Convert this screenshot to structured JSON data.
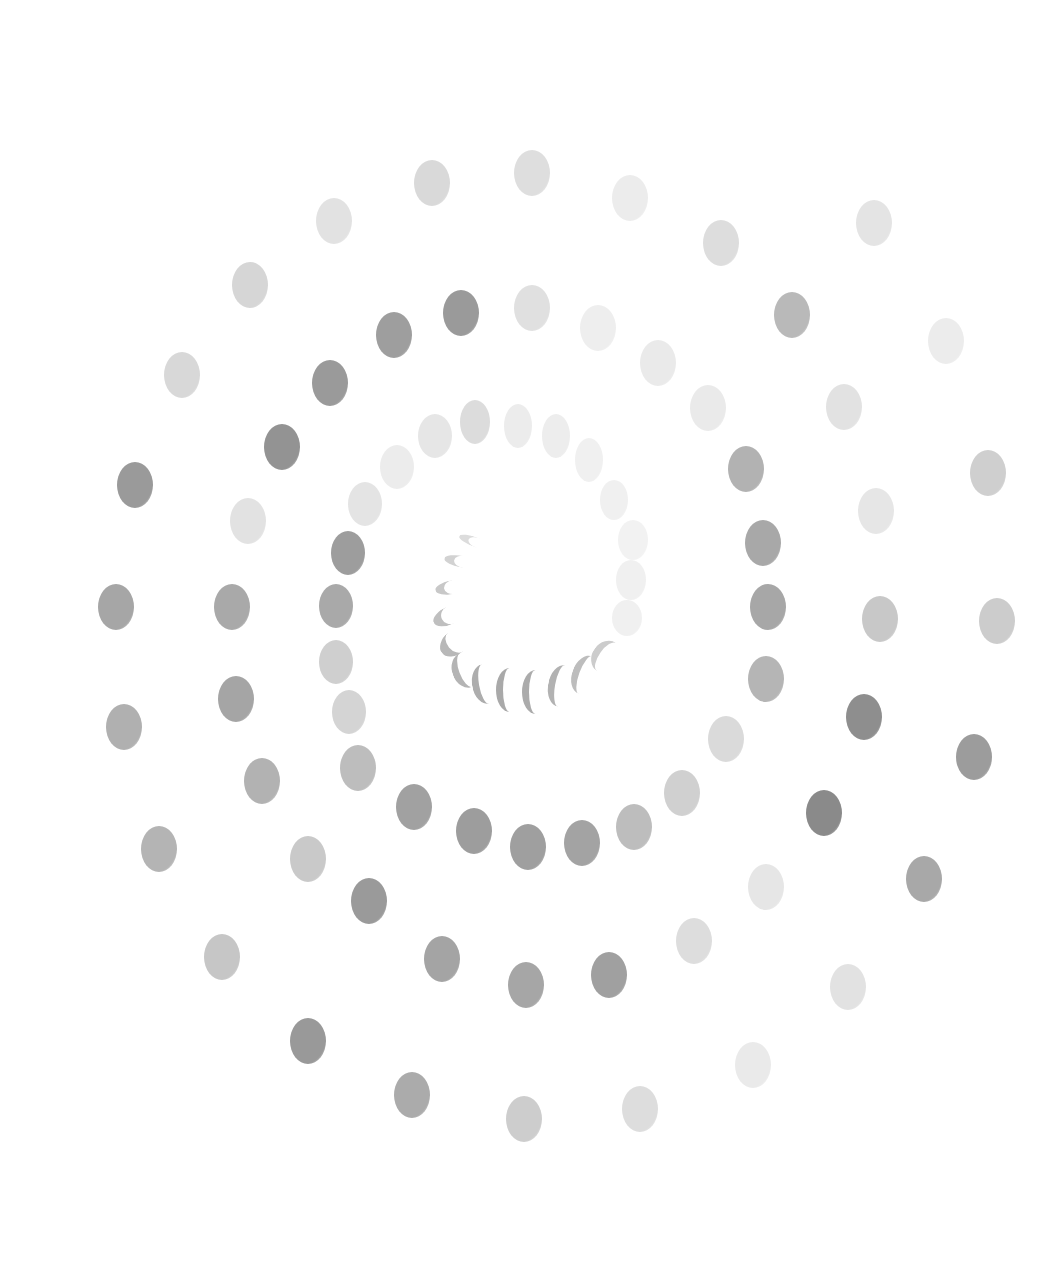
{
  "image": {
    "description": "Spiral of grey oval dots on white background",
    "background": "#ffffff",
    "width": 1043,
    "height": 1264
  },
  "dots": [
    {
      "x": 414,
      "y": 160,
      "w": 36,
      "h": 46,
      "c": "#d9d9d9"
    },
    {
      "x": 514,
      "y": 150,
      "w": 36,
      "h": 46,
      "c": "#dedede"
    },
    {
      "x": 612,
      "y": 175,
      "w": 36,
      "h": 46,
      "c": "#ececec"
    },
    {
      "x": 703,
      "y": 220,
      "w": 36,
      "h": 46,
      "c": "#dddddd"
    },
    {
      "x": 856,
      "y": 200,
      "w": 36,
      "h": 46,
      "c": "#e4e4e4"
    },
    {
      "x": 316,
      "y": 198,
      "w": 36,
      "h": 46,
      "c": "#e2e2e2"
    },
    {
      "x": 232,
      "y": 262,
      "w": 36,
      "h": 46,
      "c": "#d6d6d6"
    },
    {
      "x": 443,
      "y": 290,
      "w": 36,
      "h": 46,
      "c": "#9a9a9a"
    },
    {
      "x": 514,
      "y": 285,
      "w": 36,
      "h": 46,
      "c": "#e0e0e0"
    },
    {
      "x": 580,
      "y": 305,
      "w": 36,
      "h": 46,
      "c": "#eeeeee"
    },
    {
      "x": 640,
      "y": 340,
      "w": 36,
      "h": 46,
      "c": "#eaeaea"
    },
    {
      "x": 774,
      "y": 292,
      "w": 36,
      "h": 46,
      "c": "#b9b9b9"
    },
    {
      "x": 928,
      "y": 318,
      "w": 36,
      "h": 46,
      "c": "#ececec"
    },
    {
      "x": 376,
      "y": 312,
      "w": 36,
      "h": 46,
      "c": "#9e9e9e"
    },
    {
      "x": 312,
      "y": 360,
      "w": 36,
      "h": 46,
      "c": "#9a9a9a"
    },
    {
      "x": 164,
      "y": 352,
      "w": 36,
      "h": 46,
      "c": "#d8d8d8"
    },
    {
      "x": 690,
      "y": 385,
      "w": 36,
      "h": 46,
      "c": "#eaeaea"
    },
    {
      "x": 826,
      "y": 384,
      "w": 36,
      "h": 46,
      "c": "#e2e2e2"
    },
    {
      "x": 264,
      "y": 424,
      "w": 36,
      "h": 46,
      "c": "#939393"
    },
    {
      "x": 117,
      "y": 462,
      "w": 36,
      "h": 46,
      "c": "#9a9a9a"
    },
    {
      "x": 728,
      "y": 446,
      "w": 36,
      "h": 46,
      "c": "#b2b2b2"
    },
    {
      "x": 970,
      "y": 450,
      "w": 36,
      "h": 46,
      "c": "#cfcfcf"
    },
    {
      "x": 858,
      "y": 488,
      "w": 36,
      "h": 46,
      "c": "#e6e6e6"
    },
    {
      "x": 230,
      "y": 498,
      "w": 36,
      "h": 46,
      "c": "#e2e2e2"
    },
    {
      "x": 745,
      "y": 520,
      "w": 36,
      "h": 46,
      "c": "#a8a8a8"
    },
    {
      "x": 98,
      "y": 584,
      "w": 36,
      "h": 46,
      "c": "#a6a6a6"
    },
    {
      "x": 214,
      "y": 584,
      "w": 36,
      "h": 46,
      "c": "#a9a9a9"
    },
    {
      "x": 750,
      "y": 584,
      "w": 36,
      "h": 46,
      "c": "#a7a7a7"
    },
    {
      "x": 862,
      "y": 596,
      "w": 36,
      "h": 46,
      "c": "#c8c8c8"
    },
    {
      "x": 979,
      "y": 598,
      "w": 36,
      "h": 46,
      "c": "#cccccc"
    },
    {
      "x": 748,
      "y": 656,
      "w": 36,
      "h": 46,
      "c": "#b5b5b5"
    },
    {
      "x": 218,
      "y": 676,
      "w": 36,
      "h": 46,
      "c": "#a5a5a5"
    },
    {
      "x": 106,
      "y": 704,
      "w": 36,
      "h": 46,
      "c": "#b0b0b0"
    },
    {
      "x": 846,
      "y": 694,
      "w": 36,
      "h": 46,
      "c": "#8e8e8e"
    },
    {
      "x": 956,
      "y": 734,
      "w": 36,
      "h": 46,
      "c": "#9c9c9c"
    },
    {
      "x": 708,
      "y": 716,
      "w": 36,
      "h": 46,
      "c": "#dadada"
    },
    {
      "x": 244,
      "y": 758,
      "w": 36,
      "h": 46,
      "c": "#b2b2b2"
    },
    {
      "x": 664,
      "y": 770,
      "w": 36,
      "h": 46,
      "c": "#d0d0d0"
    },
    {
      "x": 806,
      "y": 790,
      "w": 36,
      "h": 46,
      "c": "#8a8a8a"
    },
    {
      "x": 141,
      "y": 826,
      "w": 36,
      "h": 46,
      "c": "#b4b4b4"
    },
    {
      "x": 290,
      "y": 836,
      "w": 36,
      "h": 46,
      "c": "#c9c9c9"
    },
    {
      "x": 906,
      "y": 856,
      "w": 36,
      "h": 46,
      "c": "#a8a8a8"
    },
    {
      "x": 748,
      "y": 864,
      "w": 36,
      "h": 46,
      "c": "#e6e6e6"
    },
    {
      "x": 351,
      "y": 878,
      "w": 36,
      "h": 46,
      "c": "#9a9a9a"
    },
    {
      "x": 676,
      "y": 918,
      "w": 36,
      "h": 46,
      "c": "#dddddd"
    },
    {
      "x": 204,
      "y": 934,
      "w": 36,
      "h": 46,
      "c": "#c6c6c6"
    },
    {
      "x": 424,
      "y": 936,
      "w": 36,
      "h": 46,
      "c": "#a4a4a4"
    },
    {
      "x": 508,
      "y": 962,
      "w": 36,
      "h": 46,
      "c": "#a6a6a6"
    },
    {
      "x": 591,
      "y": 952,
      "w": 36,
      "h": 46,
      "c": "#a0a0a0"
    },
    {
      "x": 830,
      "y": 964,
      "w": 36,
      "h": 46,
      "c": "#e2e2e2"
    },
    {
      "x": 290,
      "y": 1018,
      "w": 36,
      "h": 46,
      "c": "#999999"
    },
    {
      "x": 735,
      "y": 1042,
      "w": 36,
      "h": 46,
      "c": "#eaeaea"
    },
    {
      "x": 394,
      "y": 1072,
      "w": 36,
      "h": 46,
      "c": "#ababab"
    },
    {
      "x": 622,
      "y": 1086,
      "w": 36,
      "h": 46,
      "c": "#dddddd"
    },
    {
      "x": 506,
      "y": 1096,
      "w": 36,
      "h": 46,
      "c": "#cdcdcd"
    },
    {
      "x": 340,
      "y": 745,
      "w": 36,
      "h": 46,
      "c": "#bdbdbd"
    },
    {
      "x": 396,
      "y": 784,
      "w": 36,
      "h": 46,
      "c": "#a1a1a1"
    },
    {
      "x": 456,
      "y": 808,
      "w": 36,
      "h": 46,
      "c": "#9d9d9d"
    },
    {
      "x": 510,
      "y": 824,
      "w": 36,
      "h": 46,
      "c": "#9f9f9f"
    },
    {
      "x": 564,
      "y": 820,
      "w": 36,
      "h": 46,
      "c": "#a3a3a3"
    },
    {
      "x": 616,
      "y": 804,
      "w": 36,
      "h": 46,
      "c": "#bdbdbd"
    },
    {
      "x": 331,
      "y": 531,
      "w": 34,
      "h": 44,
      "c": "#9d9d9d"
    },
    {
      "x": 319,
      "y": 584,
      "w": 34,
      "h": 44,
      "c": "#a9a9a9"
    },
    {
      "x": 319,
      "y": 640,
      "w": 34,
      "h": 44,
      "c": "#cfcfcf"
    },
    {
      "x": 332,
      "y": 690,
      "w": 34,
      "h": 44,
      "c": "#d4d4d4"
    },
    {
      "x": 348,
      "y": 482,
      "w": 34,
      "h": 44,
      "c": "#e4e4e4"
    },
    {
      "x": 380,
      "y": 445,
      "w": 34,
      "h": 44,
      "c": "#ececec"
    },
    {
      "x": 418,
      "y": 414,
      "w": 34,
      "h": 44,
      "c": "#e6e6e6"
    },
    {
      "x": 460,
      "y": 400,
      "w": 30,
      "h": 44,
      "c": "#dcdcdc"
    },
    {
      "x": 504,
      "y": 404,
      "w": 28,
      "h": 44,
      "c": "#ececec"
    },
    {
      "x": 542,
      "y": 414,
      "w": 28,
      "h": 44,
      "c": "#ededed"
    },
    {
      "x": 575,
      "y": 438,
      "w": 28,
      "h": 44,
      "c": "#f0f0f0"
    },
    {
      "x": 600,
      "y": 480,
      "w": 28,
      "h": 40,
      "c": "#f0f0f0"
    },
    {
      "x": 618,
      "y": 520,
      "w": 30,
      "h": 40,
      "c": "#f2f2f2"
    },
    {
      "x": 616,
      "y": 560,
      "w": 30,
      "h": 40,
      "c": "#f0f0f0"
    },
    {
      "x": 612,
      "y": 600,
      "w": 30,
      "h": 36,
      "c": "#f0f0f0"
    }
  ],
  "crescents": [
    {
      "x": 458,
      "y": 538,
      "w": 30,
      "h": 10,
      "rot": 20,
      "c": "#dcdcdc"
    },
    {
      "x": 444,
      "y": 556,
      "w": 30,
      "h": 12,
      "rot": 10,
      "c": "#d2d2d2"
    },
    {
      "x": 435,
      "y": 580,
      "w": 28,
      "h": 14,
      "rot": -10,
      "c": "#c8c8c8"
    },
    {
      "x": 432,
      "y": 606,
      "w": 28,
      "h": 18,
      "rot": -25,
      "c": "#bfbfbf"
    },
    {
      "x": 438,
      "y": 630,
      "w": 26,
      "h": 24,
      "rot": -40,
      "c": "#b8b8b8"
    },
    {
      "x": 452,
      "y": 652,
      "w": 22,
      "h": 36,
      "rot": -20,
      "c": "#b4b4b4"
    },
    {
      "x": 472,
      "y": 664,
      "w": 20,
      "h": 40,
      "rot": -10,
      "c": "#adadad"
    },
    {
      "x": 496,
      "y": 668,
      "w": 20,
      "h": 44,
      "rot": 0,
      "c": "#a9a9a9"
    },
    {
      "x": 522,
      "y": 670,
      "w": 20,
      "h": 44,
      "rot": 0,
      "c": "#ababab"
    },
    {
      "x": 548,
      "y": 665,
      "w": 20,
      "h": 42,
      "rot": 10,
      "c": "#b2b2b2"
    },
    {
      "x": 572,
      "y": 655,
      "w": 20,
      "h": 40,
      "rot": 20,
      "c": "#bdbdbd"
    },
    {
      "x": 592,
      "y": 640,
      "w": 22,
      "h": 34,
      "rot": 35,
      "c": "#cccccc"
    }
  ]
}
